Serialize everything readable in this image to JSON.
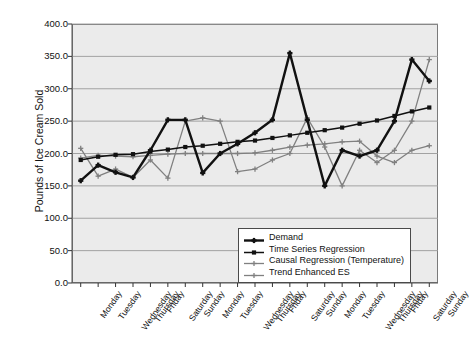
{
  "chart_data": {
    "type": "line",
    "title": "",
    "xlabel": "",
    "ylabel": "Pounds of Ice Cream Sold",
    "ylim": [
      0.0,
      400.0
    ],
    "ytick_labels": [
      "400.0",
      "350.0",
      "300.0",
      "250.0",
      "200.0",
      "150.0",
      "100.0",
      "50.0",
      "0.0"
    ],
    "ytick_values": [
      400,
      350,
      300,
      250,
      200,
      150,
      100,
      50,
      0
    ],
    "grid": true,
    "legend_position": "bottom-right",
    "categories": [
      "Monday",
      "Tuesday",
      "Wednesday",
      "Thursday",
      "Friday",
      "Saturday",
      "Sunday",
      "Monday",
      "Tuesday",
      "Wednesday",
      "Thursday",
      "Friday",
      "Saturday",
      "Sunday",
      "Monday",
      "Tuesday",
      "Wednesday",
      "Thursday",
      "Friday",
      "Saturday",
      "Sunday"
    ],
    "series": [
      {
        "name": "Demand",
        "color": "#111111",
        "marker": "plus",
        "width": 2.4,
        "values": [
          158,
          182,
          171,
          163,
          205,
          252,
          252,
          170,
          200,
          215,
          232,
          252,
          355,
          252,
          150,
          205,
          196,
          205,
          250,
          345,
          312
        ]
      },
      {
        "name": "Time Series Regression",
        "color": "#111111",
        "marker": "square",
        "width": 1.5,
        "values": [
          190,
          195,
          198,
          199,
          203,
          206,
          210,
          212,
          215,
          218,
          220,
          224,
          228,
          232,
          236,
          240,
          246,
          251,
          258,
          265,
          271
        ]
      },
      {
        "name": "Causal Regression (Temperature)",
        "color": "#808080",
        "marker": "plus",
        "width": 1.3,
        "values": [
          193,
          197,
          196,
          195,
          197,
          199,
          200,
          200,
          200,
          200,
          201,
          205,
          210,
          213,
          215,
          218,
          219,
          196,
          186,
          205,
          212
        ]
      },
      {
        "name": "Trend Enhanced ES",
        "color": "#808080",
        "marker": "plus",
        "width": 1.3,
        "values": [
          208,
          165,
          176,
          163,
          190,
          162,
          250,
          255,
          250,
          172,
          176,
          190,
          200,
          255,
          210,
          150,
          205,
          186,
          205,
          250,
          345
        ]
      }
    ]
  },
  "legend": {
    "items": [
      {
        "label": "Demand"
      },
      {
        "label": "Time Series Regression"
      },
      {
        "label": "Causal Regression (Temperature)"
      },
      {
        "label": "Trend Enhanced ES"
      }
    ]
  }
}
